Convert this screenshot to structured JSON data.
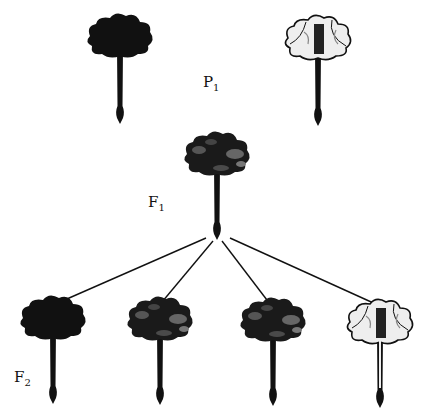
{
  "diagram": {
    "generations": [
      {
        "label": "P",
        "sub": "1",
        "flowers": [
          "dark",
          "white"
        ]
      },
      {
        "label": "F",
        "sub": "1",
        "flowers": [
          "dark-mottled"
        ]
      },
      {
        "label": "F",
        "sub": "2",
        "flowers": [
          "dark",
          "dark-mottled",
          "dark-mottled",
          "white"
        ]
      }
    ],
    "colors": {
      "ink": "#111111",
      "petal_light": "#eeeeee",
      "petal_mid": "#555555"
    }
  }
}
